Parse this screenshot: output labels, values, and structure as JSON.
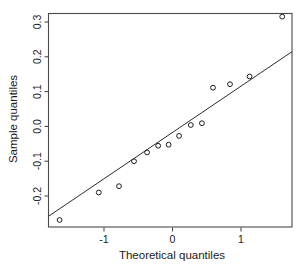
{
  "figure": {
    "background_color": "#ffffff",
    "frame_color": "#4a4a4a",
    "line_color": "#2b2b2b",
    "point_color": "#1c1c1c"
  },
  "chart_data": {
    "type": "scatter",
    "title": "",
    "subtitle": "",
    "xlabel": "Theoretical quantiles",
    "ylabel": "Sample quantiles",
    "xlim": [
      -1.95,
      1.78
    ],
    "ylim": [
      -0.255,
      0.352
    ],
    "xticks": [
      -1,
      0,
      1
    ],
    "xticklabels": [
      "-1",
      "0",
      "1"
    ],
    "yticks": [
      -0.2,
      -0.1,
      0.0,
      0.1,
      0.2,
      0.3
    ],
    "yticklabels": [
      "-0.2",
      "-0.1",
      "0.0",
      "0.1",
      "0.2",
      "0.3"
    ],
    "grid": false,
    "legend": null,
    "x": [
      -1.78,
      -1.18,
      -0.87,
      -0.64,
      -0.44,
      -0.27,
      -0.11,
      0.05,
      0.23,
      0.4,
      0.57,
      0.83,
      1.13,
      1.63
    ],
    "y": [
      -0.235,
      -0.157,
      -0.139,
      -0.068,
      -0.043,
      -0.024,
      -0.021,
      0.004,
      0.035,
      0.04,
      0.141,
      0.151,
      0.173,
      0.343
    ],
    "point_marker": "open-circle",
    "point_radius": 2.4,
    "reference_line": {
      "name": "qqline",
      "x": [
        -1.95,
        1.78
      ],
      "y": [
        -0.2245,
        0.2435
      ]
    },
    "annotations": []
  }
}
